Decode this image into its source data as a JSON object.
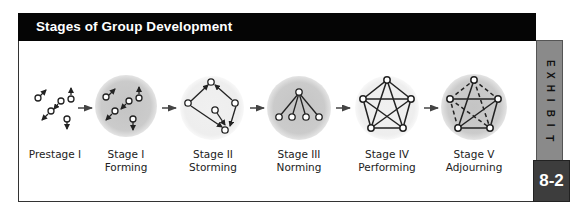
{
  "header": {
    "title": "Stages of Group Development"
  },
  "exhibit_tab": {
    "letters": [
      "E",
      "X",
      "H",
      "I",
      "B",
      "I",
      "T"
    ],
    "number": "8-2"
  },
  "stages": [
    {
      "line1": "Prestage I",
      "line2": ""
    },
    {
      "line1": "Stage I",
      "line2": "Forming"
    },
    {
      "line1": "Stage II",
      "line2": "Storming"
    },
    {
      "line1": "Stage III",
      "line2": "Norming"
    },
    {
      "line1": "Stage IV",
      "line2": "Performing"
    },
    {
      "line1": "Stage V",
      "line2": "Adjourning"
    }
  ],
  "colors": {
    "title_bar": "#050505",
    "exhibit_tab": "#8a8a8a",
    "number_box": "#3d3d3d",
    "circle_dark": "#c9c9c9",
    "circle_light": "#eeeeee"
  }
}
